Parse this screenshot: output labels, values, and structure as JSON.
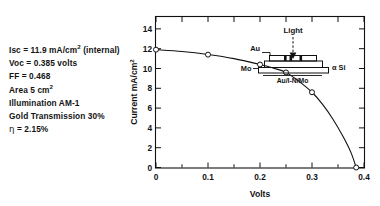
{
  "figure": {
    "specs": [
      {
        "id": "isc",
        "html_text": "Isc = 11.9 mA/cm2 (internal)",
        "plain": "Isc = 11.9 mA/cm² (internal)"
      },
      {
        "id": "voc",
        "html_text": "Voc = 0.385 volts",
        "plain": "Voc = 0.385 volts"
      },
      {
        "id": "ff",
        "html_text": "FF = 0.468",
        "plain": "FF = 0.468"
      },
      {
        "id": "area",
        "html_text": "Area 5 cm2",
        "plain": "Area 5 cm²"
      },
      {
        "id": "illumination",
        "html_text": "Illumination AM-1",
        "plain": "Illumination AM-1"
      },
      {
        "id": "gold",
        "html_text": "Gold Transmission 30%",
        "plain": "Gold Transmission 30%"
      },
      {
        "id": "eta",
        "html_text": "η = 2.15%",
        "plain": "η = 2.15%"
      }
    ],
    "spec_values": {
      "isc_label": "Isc",
      "isc_value": "11.9",
      "isc_unit": "mA/cm",
      "isc_unit_sup": "2",
      "isc_note": "(internal)",
      "voc_label": "Voc",
      "voc_value": "0.385 volts",
      "ff_label": "FF",
      "ff_value": "0.468",
      "area_label": "Area",
      "area_value": "5 cm",
      "area_sup": "2",
      "illumination_text": "Illumination AM-1",
      "gold_text": "Gold Transmission 30%",
      "eta_symbol": "η",
      "eta_value": "2.15%",
      "equals": "="
    },
    "inset": {
      "light_label": "Light",
      "au_label": "Au",
      "mo_label": "Mo",
      "asi_label": "α Si",
      "stack_label": "Au/I-N/Mo"
    }
  },
  "chart_data": {
    "type": "line",
    "title": "",
    "xlabel": "Volts",
    "ylabel": "Current mA/cm²",
    "ylabel_main": "Current mA/cm",
    "ylabel_sup": "2",
    "xlim": [
      0,
      0.4
    ],
    "ylim": [
      0,
      15.2
    ],
    "grid": false,
    "legend": false,
    "x_ticks_major": [
      0,
      0.1,
      0.2,
      0.3,
      0.4
    ],
    "x_tick_labels": [
      "0",
      "0.1",
      "0.2",
      "0.3",
      "0.4"
    ],
    "x_ticks_minor": [
      0.05,
      0.15,
      0.25,
      0.35
    ],
    "y_ticks_major": [
      0,
      2,
      4,
      6,
      8,
      10,
      12,
      14
    ],
    "y_tick_labels": [
      "0",
      "2",
      "4",
      "6",
      "8",
      "10",
      "12",
      "14"
    ],
    "series": [
      {
        "name": "I-V curve",
        "marker": "open-circle",
        "x": [
          0,
          0.1,
          0.2,
          0.25,
          0.3,
          0.385
        ],
        "y": [
          11.9,
          11.4,
          10.4,
          9.6,
          7.6,
          0.0
        ]
      }
    ],
    "curve_path_points": [
      [
        0.0,
        11.9
      ],
      [
        0.05,
        11.72
      ],
      [
        0.1,
        11.42
      ],
      [
        0.15,
        11.0
      ],
      [
        0.2,
        10.4
      ],
      [
        0.225,
        10.05
      ],
      [
        0.25,
        9.6
      ],
      [
        0.275,
        8.7
      ],
      [
        0.3,
        7.6
      ],
      [
        0.32,
        6.4
      ],
      [
        0.34,
        4.9
      ],
      [
        0.36,
        3.1
      ],
      [
        0.375,
        1.5
      ],
      [
        0.385,
        0.0
      ]
    ]
  }
}
